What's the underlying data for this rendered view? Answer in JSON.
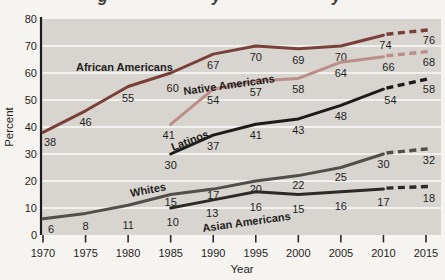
{
  "page": {
    "background": "#f6f4f0"
  },
  "cropped_title_fragments": [
    "g",
    "y",
    "y"
  ],
  "chart_data": {
    "type": "line",
    "xlabel": "Year",
    "ylabel": "Percent",
    "xlim": [
      1970,
      2015
    ],
    "ylim": [
      0,
      80
    ],
    "x_ticks": [
      1970,
      1975,
      1980,
      1985,
      1990,
      1995,
      2000,
      2005,
      2010,
      2015
    ],
    "y_ticks": [
      0,
      10,
      20,
      30,
      40,
      50,
      60,
      70,
      80
    ],
    "grid": true,
    "legend_position": "labels-on-lines",
    "dashed_segment_meaning": "2010-2015 projected values drawn dashed",
    "colors": {
      "plot_bg": "#d8d5d1",
      "grid": "#fafaf8",
      "axis": "#1c1c1c",
      "text": "#1f1e1c"
    },
    "series": [
      {
        "id": "african-americans",
        "label": "African Americans",
        "color": "#7b3f3a",
        "solid": [
          [
            1970,
            38
          ],
          [
            1975,
            46
          ],
          [
            1980,
            55
          ],
          [
            1985,
            60
          ],
          [
            1990,
            67
          ],
          [
            1995,
            70
          ],
          [
            2000,
            69
          ],
          [
            2005,
            70
          ],
          [
            2010,
            74
          ]
        ],
        "dashed": [
          [
            2010,
            74
          ],
          [
            2015,
            76
          ]
        ]
      },
      {
        "id": "native-americans",
        "label": "Native Americans",
        "color": "#bb8e89",
        "solid": [
          [
            1985,
            41
          ],
          [
            1990,
            54
          ],
          [
            1995,
            57
          ],
          [
            2000,
            58
          ],
          [
            2005,
            64
          ],
          [
            2010,
            66
          ]
        ],
        "dashed": [
          [
            2010,
            66
          ],
          [
            2015,
            68
          ]
        ]
      },
      {
        "id": "latinos",
        "label": "Latinos",
        "color": "#1d1b19",
        "solid": [
          [
            1985,
            30
          ],
          [
            1990,
            37
          ],
          [
            1995,
            41
          ],
          [
            2000,
            43
          ],
          [
            2005,
            48
          ],
          [
            2010,
            54
          ]
        ],
        "dashed": [
          [
            2010,
            54
          ],
          [
            2015,
            58
          ]
        ]
      },
      {
        "id": "whites",
        "label": "Whites",
        "color": "#524e49",
        "solid": [
          [
            1970,
            6
          ],
          [
            1975,
            8
          ],
          [
            1980,
            11
          ],
          [
            1985,
            15
          ],
          [
            1990,
            17
          ],
          [
            1995,
            20
          ],
          [
            2000,
            22
          ],
          [
            2005,
            25
          ],
          [
            2010,
            30
          ]
        ],
        "dashed": [
          [
            2010,
            30
          ],
          [
            2015,
            32
          ]
        ]
      },
      {
        "id": "asian-americans",
        "label": "Asian Americans",
        "color": "#2c2a27",
        "solid": [
          [
            1985,
            10
          ],
          [
            1990,
            13
          ],
          [
            1995,
            16
          ],
          [
            2000,
            15
          ],
          [
            2005,
            16
          ],
          [
            2010,
            17
          ]
        ],
        "dashed": [
          [
            2010,
            17
          ],
          [
            2015,
            18
          ]
        ]
      }
    ]
  }
}
